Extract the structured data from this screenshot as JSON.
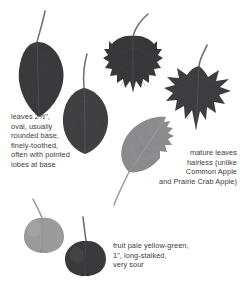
{
  "page": {
    "background_color": "#ffffff",
    "text_color": "#3b3b3d"
  },
  "captions": {
    "leaves": "leaves 2½\",\noval, usually\nrounded base,\nfinely-toothed,\noften with pointed\nlobes at base",
    "mature_leaves": "mature leaves\nhairless (unlike\nCommon Apple\nand Prairie Crab Apple)",
    "fruit": "fruit pale yellow-green,\n1\", long-stalked,\nvery sour"
  },
  "specimens": [
    {
      "id": "leaf-oval-1",
      "name": "oval leaf with long stalk",
      "type": "leaf",
      "shape": "oval",
      "tone": "dark",
      "color": "#3a3a3c"
    },
    {
      "id": "leaf-oval-2",
      "name": "oval leaf rounded base",
      "type": "leaf",
      "shape": "oval-rounded-base",
      "tone": "dark",
      "color": "#404042"
    },
    {
      "id": "leaf-toothed-3",
      "name": "finely toothed leaf",
      "type": "leaf",
      "shape": "toothed",
      "tone": "dark",
      "color": "#38383a"
    },
    {
      "id": "leaf-lobed-4",
      "name": "lobed leaf with pointed lobes",
      "type": "leaf",
      "shape": "lobed",
      "tone": "dark",
      "color": "#3d3d3f"
    },
    {
      "id": "leaf-pale-5",
      "name": "pale underside of leaf",
      "type": "leaf",
      "shape": "oval-toothed",
      "tone": "pale",
      "color": "#8b8b8d"
    },
    {
      "id": "fruit-pale-1",
      "name": "pale yellow-green fruit",
      "type": "fruit",
      "tone": "pale",
      "color": "#9b9b9c"
    },
    {
      "id": "fruit-dark-2",
      "name": "dark fruit with long stalk",
      "type": "fruit",
      "tone": "dark",
      "color": "#3a3a3c"
    }
  ]
}
